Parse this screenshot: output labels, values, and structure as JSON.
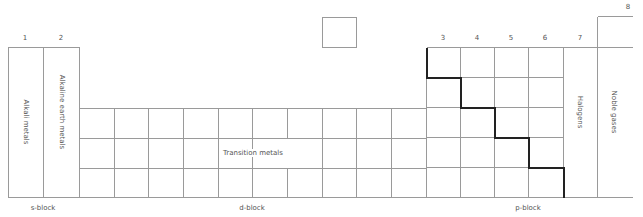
{
  "groups": [
    {
      "label": "1",
      "x": 25
    },
    {
      "label": "2",
      "x": 61
    },
    {
      "label": "3",
      "x": 443
    },
    {
      "label": "4",
      "x": 477
    },
    {
      "label": "5",
      "x": 511
    },
    {
      "label": "6",
      "x": 545
    },
    {
      "label": "7",
      "x": 580
    },
    {
      "label": "8",
      "x": 628
    }
  ],
  "families": {
    "alkali": "Alkali metals",
    "alkaline_earth": "Alkaline earth metals",
    "transition": "Transition metals",
    "halogens": "Halogens",
    "noble": "Noble gases"
  },
  "blocks": {
    "s": "s-block",
    "d": "d-block",
    "p": "p-block"
  },
  "colors": {
    "grid": "#9a9a9a",
    "staircase": "#222222",
    "text": "#555555"
  }
}
